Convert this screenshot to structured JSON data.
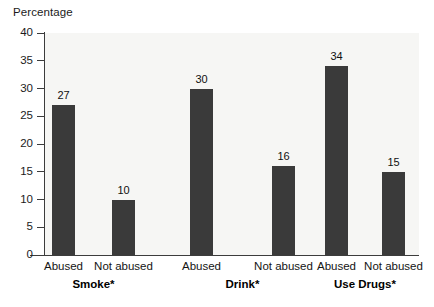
{
  "chart_data": {
    "type": "bar",
    "title": "",
    "ylabel": "Percentage",
    "xlabel": "",
    "ylim": [
      0,
      40
    ],
    "yticks": [
      0,
      5,
      10,
      15,
      20,
      25,
      30,
      35,
      40
    ],
    "ytick_labels": [
      "0",
      "5",
      "10",
      "15",
      "20",
      "25",
      "30",
      "35",
      "40"
    ],
    "grid": false,
    "legend": "none",
    "categories": [
      "Abused",
      "Not abused",
      "Abused",
      "Not abused",
      "Abused",
      "Not abused"
    ],
    "values": [
      27,
      30,
      16,
      34,
      15,
      10
    ],
    "groups": [
      {
        "label": "Smoke*",
        "bars": [
          {
            "category": "Abused",
            "value": 27,
            "value_label": "27"
          },
          {
            "category": "Not abused",
            "value": 10,
            "value_label": "10"
          }
        ]
      },
      {
        "label": "Drink*",
        "bars": [
          {
            "category": "Abused",
            "value": 30,
            "value_label": "30"
          },
          {
            "category": "Not abused",
            "value": 16,
            "value_label": "16"
          }
        ]
      },
      {
        "label": "Use Drugs*",
        "bars": [
          {
            "category": "Abused",
            "value": 34,
            "value_label": "34"
          },
          {
            "category": "Not abused",
            "value": 15,
            "value_label": "15"
          }
        ]
      }
    ],
    "colors": {
      "bar": "#3a3a3a",
      "plot_background": "#f6f6f4",
      "axis": "#3c3c3c",
      "text": "#141414",
      "page_background": "#ffffff"
    }
  },
  "axis": {
    "y_title": "Percentage",
    "ticks": [
      {
        "label": "40"
      },
      {
        "label": "35"
      },
      {
        "label": "30"
      },
      {
        "label": "25"
      },
      {
        "label": "20"
      },
      {
        "label": "15"
      },
      {
        "label": "10"
      },
      {
        "label": "5"
      },
      {
        "label": "0"
      }
    ]
  },
  "bars": [
    {
      "value_label": "27",
      "category": "Abused"
    },
    {
      "value_label": "10",
      "category": "Not abused"
    },
    {
      "value_label": "30",
      "category": "Abused"
    },
    {
      "value_label": "16",
      "category": "Not abused"
    },
    {
      "value_label": "34",
      "category": "Abused"
    },
    {
      "value_label": "15",
      "category": "Not abused"
    }
  ],
  "group_labels": [
    {
      "label": "Smoke*"
    },
    {
      "label": "Drink*"
    },
    {
      "label": "Use Drugs*"
    }
  ]
}
